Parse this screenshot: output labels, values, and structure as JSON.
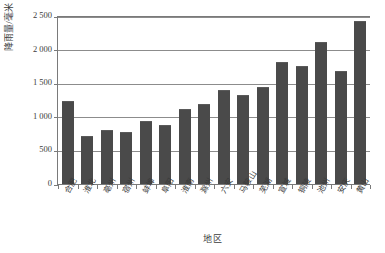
{
  "chart_data": {
    "type": "bar",
    "title": "",
    "xlabel": "地区",
    "ylabel": "降雨量/毫米",
    "ylim": [
      0,
      2500
    ],
    "ytick_step": 500,
    "ytick_labels": [
      "2 500",
      "2 000",
      "1 500",
      "1 000",
      "500",
      "0"
    ],
    "ytick_values": [
      2500,
      2000,
      1500,
      1000,
      500,
      0
    ],
    "grid": true,
    "legend": "none",
    "bar_color": "#4a4a4a",
    "axis_color": "#7a7a7a",
    "grid_color": "#8c8c8c",
    "background": "#ffffff",
    "categories": [
      "合肥",
      "淮北",
      "亳州",
      "宿州",
      "蚌埠",
      "阜阳",
      "淮南",
      "滁州",
      "六安",
      "马鞍山",
      "芜湖",
      "宣城",
      "铜陵",
      "池州",
      "安庆",
      "黄山"
    ],
    "values": [
      1250,
      730,
      820,
      790,
      950,
      890,
      1130,
      1210,
      1410,
      1345,
      1460,
      1835,
      1775,
      2130,
      1690,
      2435
    ]
  },
  "axis": {
    "y_title": "降雨量/毫米",
    "x_title": "地区"
  }
}
